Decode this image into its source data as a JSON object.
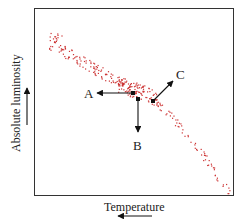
{
  "diagram": {
    "type": "hr-diagram",
    "x_axis": {
      "label": "Temperature",
      "arrow_direction": "left"
    },
    "y_axis": {
      "label": "Absolute luminosity",
      "arrow_direction": "up"
    },
    "points": [
      {
        "label": "A",
        "arrow_direction": "left"
      },
      {
        "label": "B",
        "arrow_direction": "down"
      },
      {
        "label": "C",
        "arrow_direction": "up-right"
      }
    ],
    "colors": {
      "dots": "#cc3333",
      "frame": "#333333",
      "arrows": "#111111"
    }
  }
}
